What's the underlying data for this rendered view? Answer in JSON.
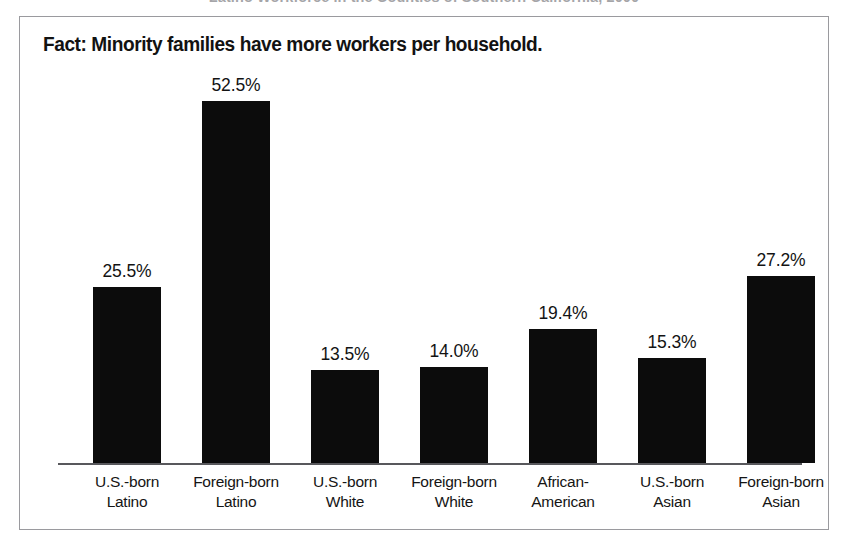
{
  "cropped_caption": "Latino Workforce in the Counties of Southern California, 2000",
  "figure": {
    "title": "Fact: Minority families have more workers per household."
  },
  "chart_data": {
    "type": "bar",
    "title": "Fact: Minority families have more workers per household.",
    "xlabel": "",
    "ylabel": "",
    "ylim": [
      0,
      52.5
    ],
    "grid": false,
    "legend": false,
    "value_suffix": "%",
    "bar_color": "#0c0c0c",
    "categories": [
      "U.S.-born Latino",
      "Foreign-born Latino",
      "U.S.-born White",
      "Foreign-born White",
      "African-American",
      "U.S.-born Asian",
      "Foreign-born Asian"
    ],
    "category_lines": [
      [
        "U.S.-born",
        "Latino"
      ],
      [
        "Foreign-born",
        "Latino"
      ],
      [
        "U.S.-born",
        "White"
      ],
      [
        "Foreign-born",
        "White"
      ],
      [
        "African-",
        "American"
      ],
      [
        "U.S.-born",
        "Asian"
      ],
      [
        "Foreign-born",
        "Asian"
      ]
    ],
    "values": [
      25.5,
      52.5,
      13.5,
      14.0,
      19.4,
      15.3,
      27.2
    ],
    "value_labels": [
      "25.5%",
      "52.5%",
      "13.5%",
      "14.0%",
      "19.4%",
      "15.3%",
      "27.2%"
    ]
  }
}
